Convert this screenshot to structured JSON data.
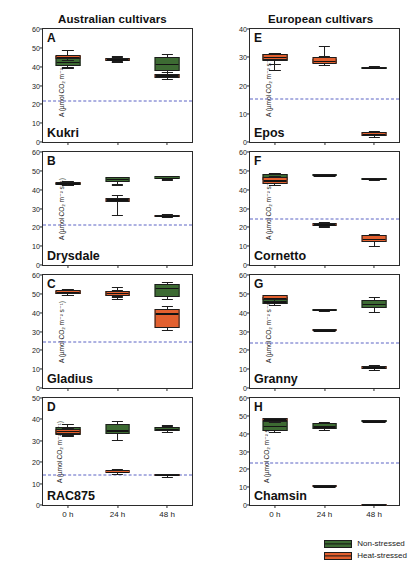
{
  "figure": {
    "columns": [
      {
        "id": "australian",
        "title": "Australian cultivars"
      },
      {
        "id": "european",
        "title": "European cultivars"
      }
    ],
    "axis_label_y": "A (µmol CO₂ m⁻² s⁻¹)",
    "x_categories": [
      "0 h",
      "24 h",
      "48 h"
    ],
    "legend": [
      {
        "label": "Non-stressed",
        "color": "#3d6b33",
        "key": "non_stressed"
      },
      {
        "label": "Heat-stressed",
        "color": "#e2602f",
        "key": "heat_stressed"
      }
    ],
    "threshold_color": "#5a63c4"
  },
  "chart_data": {
    "type": "box",
    "xlabel": "",
    "ylabel": "A (µmol CO₂ m⁻² s⁻¹)",
    "categories": [
      "0 h",
      "24 h",
      "48 h"
    ],
    "series_names": [
      "Non-stressed",
      "Heat-stressed"
    ],
    "grid": false,
    "legend_position": "bottom-right",
    "panels": [
      {
        "letter": "A",
        "cultivar": "Kukri",
        "column": "australian",
        "ylim": [
          0,
          60
        ],
        "yticks": [
          0,
          10,
          20,
          30,
          40,
          50,
          60
        ],
        "threshold": 21.7,
        "boxes": [
          {
            "x": "0 h",
            "series": "Non-stressed",
            "min": 39.6,
            "q1": 40.3,
            "median": 42.5,
            "q3": 45.4,
            "max": 46.0
          },
          {
            "x": "0 h",
            "series": "Heat-stressed",
            "min": 43.5,
            "q1": 43.9,
            "median": 45.3,
            "q3": 46.4,
            "max": 48.8
          },
          {
            "x": "24 h",
            "series": "Non-stressed",
            "min": 42.6,
            "q1": 43.0,
            "median": 43.6,
            "q3": 44.6,
            "max": 45.9
          },
          {
            "x": "24 h",
            "series": "Heat-stressed",
            "min": 42.8,
            "q1": 43.2,
            "median": 43.8,
            "q3": 44.5,
            "max": 45.2
          },
          {
            "x": "48 h",
            "series": "Non-stressed",
            "min": 37.2,
            "q1": 37.6,
            "median": 41.5,
            "q3": 45.3,
            "max": 46.9
          },
          {
            "x": "48 h",
            "series": "Heat-stressed",
            "min": 33.3,
            "q1": 33.8,
            "median": 35.5,
            "q3": 36.3,
            "max": 37.0
          }
        ]
      },
      {
        "letter": "B",
        "cultivar": "Drysdale",
        "column": "australian",
        "ylim": [
          0,
          60
        ],
        "yticks": [
          0,
          10,
          20,
          30,
          40,
          50,
          60
        ],
        "threshold": 21.5,
        "boxes": [
          {
            "x": "0 h",
            "series": "Non-stressed",
            "min": 42.4,
            "q1": 42.7,
            "median": 43.2,
            "q3": 43.6,
            "max": 43.9
          },
          {
            "x": "0 h",
            "series": "Heat-stressed",
            "min": 42.6,
            "q1": 42.9,
            "median": 43.5,
            "q3": 44.1,
            "max": 44.4
          },
          {
            "x": "24 h",
            "series": "Non-stressed",
            "min": 42.8,
            "q1": 44.3,
            "median": 45.9,
            "q3": 46.5,
            "max": 46.9
          },
          {
            "x": "24 h",
            "series": "Heat-stressed",
            "min": 26.7,
            "q1": 33.6,
            "median": 35.0,
            "q3": 35.6,
            "max": 37.0
          },
          {
            "x": "48 h",
            "series": "Non-stressed",
            "min": 45.4,
            "q1": 45.7,
            "median": 46.3,
            "q3": 47.1,
            "max": 47.4
          },
          {
            "x": "48 h",
            "series": "Heat-stressed",
            "min": 25.7,
            "q1": 25.9,
            "median": 26.4,
            "q3": 26.8,
            "max": 27.0
          }
        ]
      },
      {
        "letter": "C",
        "cultivar": "Gladius",
        "column": "australian",
        "ylim": [
          0,
          60
        ],
        "yticks": [
          0,
          10,
          20,
          30,
          40,
          50,
          60
        ],
        "threshold": 24.6,
        "boxes": [
          {
            "x": "0 h",
            "series": "Non-stressed",
            "min": 49.6,
            "q1": 49.9,
            "median": 50.6,
            "q3": 51.3,
            "max": 51.7
          },
          {
            "x": "0 h",
            "series": "Heat-stressed",
            "min": 49.3,
            "q1": 49.8,
            "median": 50.9,
            "q3": 52.1,
            "max": 52.5
          },
          {
            "x": "24 h",
            "series": "Non-stressed",
            "min": 48.6,
            "q1": 49.1,
            "median": 50.3,
            "q3": 51.4,
            "max": 51.9
          },
          {
            "x": "24 h",
            "series": "Heat-stressed",
            "min": 47.3,
            "q1": 48.9,
            "median": 50.6,
            "q3": 51.6,
            "max": 53.6
          },
          {
            "x": "48 h",
            "series": "Non-stressed",
            "min": 47.4,
            "q1": 48.5,
            "median": 53.6,
            "q3": 55.2,
            "max": 56.1
          },
          {
            "x": "48 h",
            "series": "Heat-stressed",
            "min": 30.7,
            "q1": 32.0,
            "median": 39.9,
            "q3": 42.2,
            "max": 43.4
          }
        ]
      },
      {
        "letter": "D",
        "cultivar": "RAC875",
        "column": "australian",
        "ylim": [
          0,
          50
        ],
        "yticks": [
          0,
          10,
          20,
          30,
          40,
          50
        ],
        "threshold": 14.0,
        "boxes": [
          {
            "x": "0 h",
            "series": "Non-stressed",
            "min": 32.1,
            "q1": 32.6,
            "median": 35.0,
            "q3": 36.6,
            "max": 38.0
          },
          {
            "x": "0 h",
            "series": "Heat-stressed",
            "min": 33.0,
            "q1": 33.4,
            "median": 34.6,
            "q3": 35.6,
            "max": 36.1
          },
          {
            "x": "24 h",
            "series": "Non-stressed",
            "min": 30.5,
            "q1": 33.3,
            "median": 34.7,
            "q3": 37.7,
            "max": 39.4
          },
          {
            "x": "24 h",
            "series": "Heat-stressed",
            "min": 14.7,
            "q1": 15.1,
            "median": 15.6,
            "q3": 16.2,
            "max": 17.0
          },
          {
            "x": "48 h",
            "series": "Non-stressed",
            "min": 34.2,
            "q1": 34.6,
            "median": 35.4,
            "q3": 36.3,
            "max": 37.2
          },
          {
            "x": "48 h",
            "series": "Heat-stressed",
            "min": 13.2,
            "q1": 13.5,
            "median": 14.0,
            "q3": 14.4,
            "max": 14.7
          }
        ]
      },
      {
        "letter": "E",
        "cultivar": "Epos",
        "column": "european",
        "ylim": [
          0,
          40
        ],
        "yticks": [
          0,
          10,
          20,
          30,
          40
        ],
        "threshold": 15.3,
        "boxes": [
          {
            "x": "0 h",
            "series": "Non-stressed",
            "min": 25.4,
            "q1": 28.6,
            "median": 30.1,
            "q3": 31.1,
            "max": 31.6
          },
          {
            "x": "0 h",
            "series": "Heat-stressed",
            "min": 27.6,
            "q1": 28.9,
            "median": 30.0,
            "q3": 31.2,
            "max": 31.5
          },
          {
            "x": "24 h",
            "series": "Non-stressed",
            "min": 27.4,
            "q1": 27.8,
            "median": 28.5,
            "q3": 29.4,
            "max": 33.9
          },
          {
            "x": "24 h",
            "series": "Heat-stressed",
            "min": 27.2,
            "q1": 27.7,
            "median": 28.8,
            "q3": 30.1,
            "max": 30.5
          },
          {
            "x": "48 h",
            "series": "Non-stressed",
            "min": 26.2,
            "q1": 26.3,
            "median": 26.5,
            "q3": 26.7,
            "max": 26.8
          },
          {
            "x": "48 h",
            "series": "Heat-stressed",
            "min": 1.7,
            "q1": 2.2,
            "median": 2.9,
            "q3": 3.5,
            "max": 4.0
          }
        ]
      },
      {
        "letter": "F",
        "cultivar": "Cornetto",
        "column": "european",
        "ylim": [
          0,
          60
        ],
        "yticks": [
          0,
          10,
          20,
          30,
          40,
          50,
          60
        ],
        "threshold": 24.2,
        "boxes": [
          {
            "x": "0 h",
            "series": "Non-stressed",
            "min": 44.8,
            "q1": 45.3,
            "median": 46.8,
            "q3": 48.2,
            "max": 48.7
          },
          {
            "x": "0 h",
            "series": "Heat-stressed",
            "min": 42.6,
            "q1": 43.1,
            "median": 44.9,
            "q3": 46.6,
            "max": 47.1
          },
          {
            "x": "24 h",
            "series": "Non-stressed",
            "min": 47.2,
            "q1": 47.4,
            "median": 47.8,
            "q3": 48.2,
            "max": 48.4
          },
          {
            "x": "24 h",
            "series": "Heat-stressed",
            "min": 20.5,
            "q1": 20.9,
            "median": 21.6,
            "q3": 22.3,
            "max": 22.7
          },
          {
            "x": "48 h",
            "series": "Non-stressed",
            "min": 45.4,
            "q1": 45.6,
            "median": 45.9,
            "q3": 46.2,
            "max": 46.4
          },
          {
            "x": "48 h",
            "series": "Heat-stressed",
            "min": 10.3,
            "q1": 12.0,
            "median": 13.7,
            "q3": 15.7,
            "max": 16.5
          }
        ]
      },
      {
        "letter": "G",
        "cultivar": "Granny",
        "column": "european",
        "ylim": [
          0,
          60
        ],
        "yticks": [
          0,
          10,
          20,
          30,
          40,
          50,
          60
        ],
        "threshold": 24.1,
        "boxes": [
          {
            "x": "0 h",
            "series": "Non-stressed",
            "min": 44.0,
            "q1": 44.4,
            "median": 46.0,
            "q3": 48.2,
            "max": 48.7
          },
          {
            "x": "0 h",
            "series": "Heat-stressed",
            "min": 46.4,
            "q1": 46.8,
            "median": 47.9,
            "q3": 49.2,
            "max": 49.6
          },
          {
            "x": "24 h",
            "series": "Non-stressed",
            "min": 41.0,
            "q1": 41.2,
            "median": 41.6,
            "q3": 42.0,
            "max": 42.2
          },
          {
            "x": "24 h",
            "series": "Heat-stressed",
            "min": 30.3,
            "q1": 30.5,
            "median": 30.8,
            "q3": 31.1,
            "max": 31.3
          },
          {
            "x": "48 h",
            "series": "Non-stressed",
            "min": 40.4,
            "q1": 42.3,
            "median": 44.7,
            "q3": 46.8,
            "max": 48.2
          },
          {
            "x": "48 h",
            "series": "Heat-stressed",
            "min": 9.6,
            "q1": 10.2,
            "median": 11.0,
            "q3": 11.7,
            "max": 12.1
          }
        ]
      },
      {
        "letter": "H",
        "cultivar": "Chamsin",
        "column": "european",
        "ylim": [
          0,
          60
        ],
        "yticks": [
          0,
          10,
          20,
          30,
          40,
          50,
          60
        ],
        "threshold": 23.6,
        "boxes": [
          {
            "x": "0 h",
            "series": "Non-stressed",
            "min": 41.0,
            "q1": 41.5,
            "median": 44.2,
            "q3": 47.2,
            "max": 47.8
          },
          {
            "x": "0 h",
            "series": "Heat-stressed",
            "min": 46.8,
            "q1": 47.2,
            "median": 47.9,
            "q3": 48.7,
            "max": 49.0
          },
          {
            "x": "24 h",
            "series": "Non-stressed",
            "min": 42.1,
            "q1": 42.5,
            "median": 44.0,
            "q3": 46.0,
            "max": 46.4
          },
          {
            "x": "24 h",
            "series": "Heat-stressed",
            "min": 10.2,
            "q1": 10.4,
            "median": 10.7,
            "q3": 11.0,
            "max": 11.2
          },
          {
            "x": "48 h",
            "series": "Non-stressed",
            "min": 46.6,
            "q1": 46.8,
            "median": 47.1,
            "q3": 47.4,
            "max": 47.6
          },
          {
            "x": "48 h",
            "series": "Heat-stressed",
            "min": 0.2,
            "q1": 0.3,
            "median": 0.5,
            "q3": 0.7,
            "max": 0.8
          }
        ]
      }
    ]
  }
}
